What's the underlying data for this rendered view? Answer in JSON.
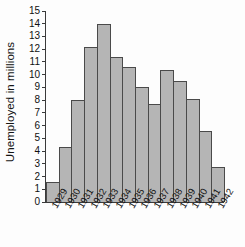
{
  "chart_data": {
    "type": "bar",
    "title": "",
    "xlabel": "",
    "ylabel": "Unemployed in millions",
    "ylim": [
      0,
      15
    ],
    "ytick_labels": [
      "15",
      "14",
      "13",
      "12",
      "11",
      "10",
      "9",
      "8",
      "7",
      "6",
      "5",
      "4",
      "3",
      "2",
      "1",
      "0"
    ],
    "yticks": [
      15,
      14,
      13,
      12,
      11,
      10,
      9,
      8,
      7,
      6,
      5,
      4,
      3,
      2,
      1,
      0
    ],
    "grid": false,
    "legend": false,
    "categories": [
      "1929",
      "1930",
      "1931",
      "1932",
      "1933",
      "1934",
      "1935",
      "1936",
      "1937",
      "1938",
      "1939",
      "1940",
      "1941",
      "1942"
    ],
    "values": [
      1.55,
      4.3,
      8.0,
      12.15,
      14.0,
      11.35,
      10.6,
      9.0,
      7.7,
      10.4,
      9.5,
      8.1,
      5.6,
      2.75
    ],
    "bar_color": "#b5b5b5",
    "bar_border_color": "#4a4a4a",
    "axis_color": "#3a3a3a",
    "background_color": "#fdfdfd"
  }
}
